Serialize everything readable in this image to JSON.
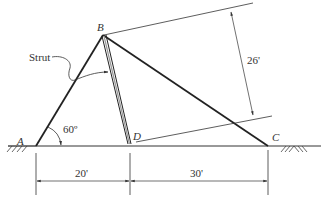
{
  "diagram": {
    "type": "truss-structure",
    "points": {
      "A": {
        "label": "A"
      },
      "B": {
        "label": "B"
      },
      "C": {
        "label": "C"
      },
      "D": {
        "label": "D"
      }
    },
    "annotations": {
      "strut_label": "Strut",
      "angle_label": "60º",
      "dim_AD": "20'",
      "dim_DC": "30'",
      "dim_perp": "26'"
    },
    "members": [
      "AB",
      "BC",
      "BD (strut)"
    ],
    "supports": [
      "A (pin, ground)",
      "C (pin, ground)"
    ],
    "colors": {
      "line": "#222222",
      "dimension": "#444444"
    }
  }
}
